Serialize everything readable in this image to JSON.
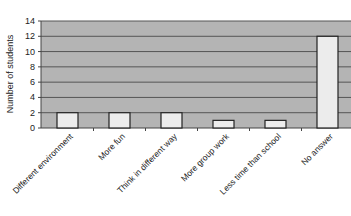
{
  "chart_data": {
    "type": "bar",
    "title": "",
    "xlabel": "",
    "ylabel": "Number of students",
    "categories": [
      "Different environment",
      "More fun",
      "Think in different way",
      "More group work",
      "Less time than school",
      "No answer"
    ],
    "values": [
      2,
      2,
      2,
      1,
      1,
      12
    ],
    "ylim": [
      0,
      14
    ],
    "yticks": [
      0,
      2,
      4,
      6,
      8,
      10,
      12,
      14
    ],
    "grid": true,
    "legend": null,
    "colors": {
      "plot_bg": "#b4b4b4",
      "bar_fill": "#ececec",
      "bar_stroke": "#222222",
      "grid": "#555555"
    }
  }
}
